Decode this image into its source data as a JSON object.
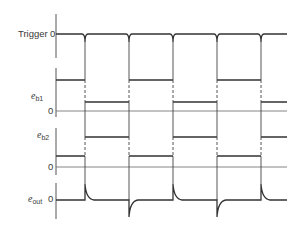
{
  "diagram": {
    "traces": [
      {
        "id": "trigger",
        "label": "Trigger",
        "label_sub": "",
        "zero_label": "0"
      },
      {
        "id": "eb1",
        "label": "e",
        "label_sub": "b1",
        "zero_label": "0"
      },
      {
        "id": "eb2",
        "label": "e",
        "label_sub": "b2",
        "zero_label": "0"
      },
      {
        "id": "eout",
        "label": "e",
        "label_sub": "out",
        "zero_label": "0"
      }
    ],
    "transition_count": 5,
    "colors": {
      "line": "#333333",
      "background": "#ffffff"
    }
  }
}
